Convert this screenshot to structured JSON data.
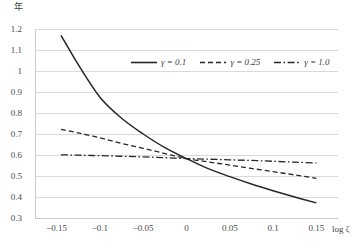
{
  "chart_data": {
    "type": "line",
    "title": "",
    "xlabel": "log ζ",
    "ylabel": "年",
    "xlim": [
      -0.175,
      0.175
    ],
    "ylim": [
      0.3,
      1.2
    ],
    "grid": true,
    "legend_position": "top-center",
    "x_ticks": [
      "-0.15",
      "-0.1",
      "-0.05",
      "0",
      "0.05",
      "0.1",
      "0.15"
    ],
    "x_tick_values": [
      -0.15,
      -0.1,
      -0.05,
      0,
      0.05,
      0.1,
      0.15
    ],
    "y_ticks": [
      "1.2",
      "1.1",
      "1",
      "0.9",
      "0.8",
      "0.7",
      "0.6",
      "0.5",
      "0.4",
      "0.3"
    ],
    "y_tick_values": [
      1.2,
      1.1,
      1.0,
      0.9,
      0.8,
      0.7,
      0.6,
      0.5,
      0.4,
      0.3
    ],
    "x": [
      -0.145,
      -0.125,
      -0.1,
      -0.075,
      -0.05,
      -0.025,
      0,
      0.025,
      0.05,
      0.075,
      0.1,
      0.125,
      0.15
    ],
    "series": [
      {
        "name": "γ = 0.1",
        "gamma": 0.1,
        "style": "solid",
        "color": "#262626",
        "values": [
          1.17,
          1.03,
          0.875,
          0.775,
          0.7,
          0.635,
          0.583,
          0.535,
          0.497,
          0.462,
          0.43,
          0.4,
          0.372
        ]
      },
      {
        "name": "γ = 0.25",
        "gamma": 0.25,
        "style": "dashed",
        "color": "#262626",
        "values": [
          0.722,
          0.705,
          0.682,
          0.655,
          0.632,
          0.607,
          0.583,
          0.567,
          0.552,
          0.536,
          0.521,
          0.505,
          0.489
        ]
      },
      {
        "name": "γ = 1.0",
        "gamma": 1.0,
        "style": "dashdot",
        "color": "#262626",
        "values": [
          0.601,
          0.599,
          0.597,
          0.594,
          0.591,
          0.587,
          0.583,
          0.58,
          0.577,
          0.574,
          0.57,
          0.566,
          0.562
        ]
      }
    ]
  },
  "axes": {
    "y_title": "年",
    "x_title": "log ζ"
  },
  "legend": {
    "entries": [
      {
        "label": "γ = 0.1",
        "style": "solid"
      },
      {
        "label": "γ = 0.25",
        "style": "dashed"
      },
      {
        "label": "γ = 1.0",
        "style": "dashdot"
      }
    ]
  }
}
